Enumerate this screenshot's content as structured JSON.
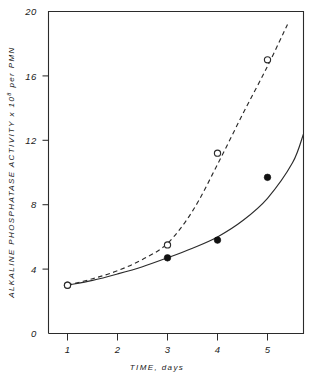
{
  "chart_data": {
    "type": "line",
    "title": "",
    "subtitle": "",
    "xlabel": "TIME, days",
    "ylabel_parts": {
      "pre": "ALKALINE PHOSPHATASE ACTIVITY x 10",
      "sup": "8",
      "post": " per PMN"
    },
    "ylabel": "ALKALINE PHOSPHATASE ACTIVITY x 10^8 per PMN",
    "xlim": [
      0.62,
      5.72
    ],
    "ylim": [
      0,
      20
    ],
    "xticks": [
      1,
      2,
      3,
      4,
      5
    ],
    "xtick_labels": [
      "1",
      "2",
      "3",
      "4",
      "5"
    ],
    "yticks": [
      0,
      4,
      8,
      12,
      16,
      20
    ],
    "ytick_labels": [
      "0",
      "4",
      "8",
      "12",
      "16",
      "20"
    ],
    "grid": false,
    "legend": "none",
    "legend_position": "none",
    "axis_color": "#2b2b2b",
    "background_color": "#ffffff",
    "series": [
      {
        "name": "filled-circles",
        "marker": "filled-circle",
        "linestyle": "solid",
        "color": "#2b2b2b",
        "x": [
          1,
          3,
          4,
          5
        ],
        "values": [
          3.0,
          4.7,
          5.8,
          9.7
        ],
        "fit_curve": {
          "x": [
            1.0,
            1.5,
            2.0,
            2.5,
            3.0,
            3.5,
            4.0,
            4.5,
            5.0,
            5.5,
            5.72
          ],
          "y": [
            3.0,
            3.3,
            3.7,
            4.15,
            4.7,
            5.3,
            6.0,
            7.0,
            8.4,
            10.6,
            12.4
          ]
        }
      },
      {
        "name": "open-circles",
        "marker": "open-circle",
        "linestyle": "dashed",
        "color": "#2b2b2b",
        "x": [
          1,
          3,
          4,
          5
        ],
        "values": [
          3.0,
          5.5,
          11.2,
          17.0
        ],
        "fit_curve": {
          "x": [
            1.0,
            1.5,
            2.0,
            2.5,
            3.0,
            3.5,
            4.0,
            4.5,
            5.0,
            5.4
          ],
          "y": [
            3.0,
            3.4,
            3.9,
            4.6,
            5.6,
            7.6,
            10.5,
            13.6,
            16.6,
            19.2
          ]
        }
      }
    ]
  }
}
